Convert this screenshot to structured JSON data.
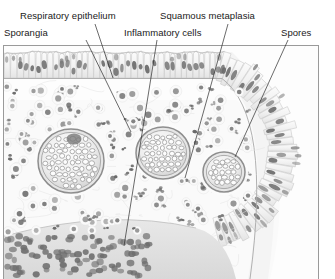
{
  "figure": {
    "kind": "histology-illustration",
    "frame": {
      "x": 3,
      "y": 45,
      "width": 316,
      "height": 234,
      "border_color": "#9a9a9a"
    },
    "background_color": "#ffffff",
    "ink_color": "#5a5a5a",
    "nucleus_color": "#6f6f6f",
    "label_color": "#1a1a1a"
  },
  "labels": [
    {
      "id": "sporangia",
      "name": "Sporangia",
      "text": "Sporangia",
      "x": 4,
      "y": 27,
      "leader": {
        "x1": 86,
        "y1": 40,
        "x2": 131,
        "y2": 132
      }
    },
    {
      "id": "respiratory-epithelium",
      "name": "Respiratory epithelium",
      "text": "Respiratory epithelium",
      "x": 20,
      "y": 10,
      "leader": {
        "x1": 95,
        "y1": 24,
        "x2": 113,
        "y2": 78
      }
    },
    {
      "id": "inflammatory-cells",
      "name": "Inflammatory cells",
      "text": "Inflammatory cells",
      "x": 124,
      "y": 27,
      "leader": {
        "x1": 157,
        "y1": 40,
        "x2": 124,
        "y2": 246
      }
    },
    {
      "id": "squamous-metaplasia",
      "name": "Squamous metaplasia",
      "text": "Squamous metaplasia",
      "x": 160,
      "y": 10,
      "leader": {
        "x1": 228,
        "y1": 24,
        "x2": 185,
        "y2": 178
      }
    },
    {
      "id": "spores",
      "name": "Spores",
      "text": "Spores",
      "x": 281,
      "y": 27,
      "leader": {
        "x1": 288,
        "y1": 40,
        "x2": 235,
        "y2": 157
      }
    }
  ],
  "structures": {
    "sporangia": [
      {
        "id": "sporangium-1",
        "cx": 71,
        "cy": 161,
        "rx": 33,
        "ry": 32,
        "spore_count": 74,
        "note": "largest, dark focus at upper pole"
      },
      {
        "id": "sporangium-2",
        "cx": 163,
        "cy": 153,
        "rx": 27,
        "ry": 26,
        "spore_count": 52
      },
      {
        "id": "sporangium-3",
        "cx": 224,
        "cy": 172,
        "rx": 21,
        "ry": 20,
        "spore_count": 34
      }
    ],
    "epithelium": {
      "type": "pseudostratified ciliated columnar",
      "cell_count": 96,
      "cell_height": 26,
      "nucleus_shape": "elongated oval, basally placed"
    },
    "stroma": {
      "inflammatory_cell_count": 168,
      "cell_types": [
        "neutrophil",
        "lymphocyte",
        "plasma cell"
      ],
      "dense_band_label": "basal dense infiltrate"
    }
  }
}
